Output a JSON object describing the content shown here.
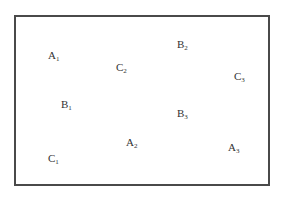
{
  "diagram": {
    "labels": [
      {
        "id": "A1",
        "letter": "A",
        "index": "1"
      },
      {
        "id": "C2",
        "letter": "C",
        "index": "2"
      },
      {
        "id": "B2",
        "letter": "B",
        "index": "2"
      },
      {
        "id": "C3",
        "letter": "C",
        "index": "3"
      },
      {
        "id": "B1",
        "letter": "B",
        "index": "1"
      },
      {
        "id": "B3",
        "letter": "B",
        "index": "3"
      },
      {
        "id": "A2",
        "letter": "A",
        "index": "2"
      },
      {
        "id": "C1",
        "letter": "C",
        "index": "1"
      },
      {
        "id": "A3",
        "letter": "A",
        "index": "3"
      }
    ]
  }
}
